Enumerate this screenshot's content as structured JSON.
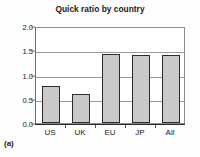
{
  "panel": {
    "label": "(a)"
  },
  "chart_data": {
    "type": "bar",
    "title": "Quick ratio by country",
    "xlabel": "",
    "ylabel": "",
    "categories": [
      "US",
      "UK",
      "EU",
      "JP",
      "All"
    ],
    "values": [
      0.77,
      0.6,
      1.42,
      1.41,
      1.41
    ],
    "ylim": [
      0.0,
      2.0
    ],
    "yticks": [
      0.0,
      0.5,
      1.0,
      1.5,
      2.0
    ],
    "ytick_labels": [
      "0.0",
      "0.5",
      "1.0",
      "1.5",
      "2.0"
    ],
    "grid": true,
    "grid_axis": "y",
    "legend": false,
    "legend_position": "none",
    "bar_fill_color": "#c9c9c9",
    "bar_edge_color": "#2b2b2b",
    "grid_color": "#9a9a9a",
    "axis_color": "#2b2b2b",
    "background_color": "#ffffff"
  }
}
